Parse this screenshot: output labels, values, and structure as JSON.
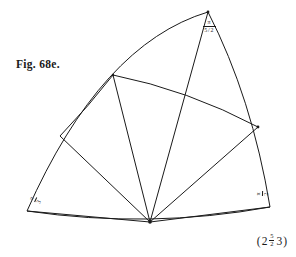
{
  "figure": {
    "caption": "Fig. 68e.",
    "plate_note": {
      "open_paren": "(",
      "left_number": "2",
      "fraction": {
        "numerator": "5",
        "denominator": "2"
      },
      "right_number": "3",
      "close_paren": ")",
      "full_text": "(2 5/2 3)"
    },
    "stroke_color": "#1a1a1a",
    "background_color": "#ffffff"
  },
  "labels": {
    "apex": {
      "name": "apex-angle-label",
      "numerator": "π",
      "denominator_numerator": "5",
      "denominator_slash": "/",
      "denominator_denominator": "2",
      "reading": "pi / (5/2)"
    },
    "left_corner": {
      "name": "left-corner-angle-label",
      "numerator": "π",
      "denominator": "3",
      "reading": "pi/3",
      "rotation_deg": -65
    },
    "right_corner": {
      "name": "right-corner-angle-label",
      "numerator": "π",
      "denominator": "2",
      "reading": "pi/2",
      "rotation_deg": -88
    }
  },
  "geometry": {
    "description": "Curved spherical triangle sector with a fan of geodesic lines radiating from a bottom apex, bounded by an outer arc and crossed by an inner arc.",
    "vertices": {
      "fan_center": [
        150,
        222
      ],
      "apex_top": [
        208,
        12
      ],
      "left_base": [
        27,
        211
      ],
      "right_base": [
        270,
        207
      ],
      "inner_left": [
        113,
        75
      ],
      "inner_right": [
        258,
        127
      ],
      "left_mid": [
        60,
        136
      ],
      "inner_cross": [
        185,
        93
      ]
    },
    "paths": {
      "outer_arc_left": "M 208 12 Q 100 40 27 211",
      "outer_arc_bottom": "M 27 211 Q 150 228 270 207",
      "outer_arc_right": "M 208 12 Q 250 100 270 207",
      "inner_arc": "M 113 75 Q 190 92 258 127",
      "left_short_arc": "M 60 136 Q 90 104 113 75"
    },
    "fan_lines": [
      {
        "name": "ray-to-left-base",
        "from": [
          150,
          222
        ],
        "to": [
          27,
          211
        ]
      },
      {
        "name": "ray-to-left-mid",
        "from": [
          150,
          222
        ],
        "to": [
          60,
          136
        ]
      },
      {
        "name": "ray-to-inner-left",
        "from": [
          150,
          222
        ],
        "to": [
          113,
          75
        ]
      },
      {
        "name": "ray-to-apex",
        "from": [
          150,
          222
        ],
        "to": [
          208,
          12
        ]
      },
      {
        "name": "ray-to-inner-right",
        "from": [
          150,
          222
        ],
        "to": [
          258,
          127
        ]
      },
      {
        "name": "ray-to-right-base",
        "from": [
          150,
          222
        ],
        "to": [
          270,
          207
        ]
      }
    ]
  }
}
